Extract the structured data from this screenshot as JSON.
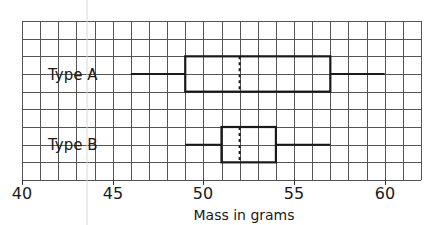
{
  "chart_data": {
    "type": "boxplot",
    "title": "",
    "xlabel": "Mass in grams",
    "ylabel": "",
    "xlim": [
      40,
      62
    ],
    "x_ticks": [
      40,
      45,
      50,
      55,
      60
    ],
    "x_tick_labels": [
      "40",
      "45",
      "50",
      "55",
      "60"
    ],
    "grid": true,
    "grid_minor_step": 1,
    "legend": null,
    "series": [
      {
        "name": "Type A",
        "min": 46,
        "q1": 49,
        "median": 52,
        "q3": 57,
        "max": 60
      },
      {
        "name": "Type B",
        "min": 49,
        "q1": 51,
        "median": 52,
        "q3": 54,
        "max": 57
      }
    ]
  },
  "labels": {
    "type_a": "Type A",
    "type_b": "Type B",
    "xlabel": "Mass in grams",
    "ticks": [
      "40",
      "45",
      "50",
      "55",
      "60"
    ]
  }
}
